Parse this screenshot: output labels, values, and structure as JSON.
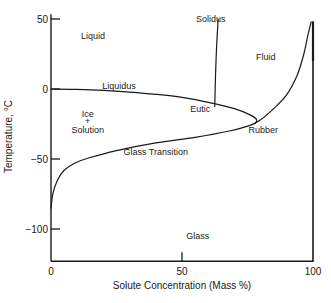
{
  "chart_data": {
    "type": "line",
    "title": "",
    "xlabel": "Solute Concentration (Mass %)",
    "ylabel": "Temperature, °C",
    "xlim": [
      0,
      100
    ],
    "ylim": [
      -123,
      52
    ],
    "grid": false,
    "x_ticks": [
      0,
      50,
      100
    ],
    "x_tick_labels": [
      "0",
      "50",
      "100"
    ],
    "y_ticks": [
      50,
      0,
      -50,
      -100
    ],
    "y_tick_labels": [
      "50",
      "0",
      "−50",
      "−100"
    ],
    "series": [
      {
        "name": "Liquidus",
        "points": [
          [
            0,
            0
          ],
          [
            10,
            -0.3
          ],
          [
            20,
            -1
          ],
          [
            30,
            -2.2
          ],
          [
            40,
            -3.8
          ],
          [
            50,
            -6
          ],
          [
            60,
            -9.5
          ],
          [
            70,
            -14
          ],
          [
            76,
            -18.5
          ],
          [
            78.5,
            -22
          ],
          [
            78,
            -24.5
          ]
        ]
      },
      {
        "name": "Solidus",
        "points": [
          [
            62.5,
            -12.5
          ],
          [
            62.8,
            10
          ],
          [
            63.2,
            30
          ],
          [
            63.8,
            50
          ]
        ]
      },
      {
        "name": "Glass Transition",
        "points": [
          [
            0,
            -85
          ],
          [
            0.8,
            -74
          ],
          [
            2.5,
            -65
          ],
          [
            5,
            -58
          ],
          [
            9,
            -53
          ],
          [
            14,
            -49.5
          ],
          [
            25,
            -44
          ],
          [
            40,
            -38.5
          ],
          [
            55,
            -34.5
          ],
          [
            68,
            -30
          ],
          [
            76,
            -26
          ],
          [
            80,
            -22
          ],
          [
            85,
            -14
          ],
          [
            90,
            -4
          ],
          [
            94,
            10
          ],
          [
            96.5,
            25
          ],
          [
            98,
            38
          ],
          [
            99.3,
            48
          ]
        ]
      },
      {
        "name": "Right boundary (100%)",
        "points": [
          [
            100,
            48
          ],
          [
            100,
            -123
          ]
        ]
      }
    ],
    "annotations": [
      {
        "text": "Liquid",
        "x": 16,
        "y": 38
      },
      {
        "text": "Solidus",
        "x": 61,
        "y": 50
      },
      {
        "text": "Fluid",
        "x": 82,
        "y": 23
      },
      {
        "text": "Liquidus",
        "x": 26,
        "y": 2
      },
      {
        "text": "Eutic",
        "x": 57,
        "y": -14
      },
      {
        "text": "Ice",
        "x": 14,
        "y": -18
      },
      {
        "text": "+",
        "x": 14,
        "y": -23
      },
      {
        "text": "Solution",
        "x": 14,
        "y": -29
      },
      {
        "text": "Rubber",
        "x": 81,
        "y": -29
      },
      {
        "text": "Glass Transition",
        "x": 40,
        "y": -45
      },
      {
        "text": "Glass",
        "x": 56,
        "y": -105
      }
    ],
    "legend": "none"
  }
}
